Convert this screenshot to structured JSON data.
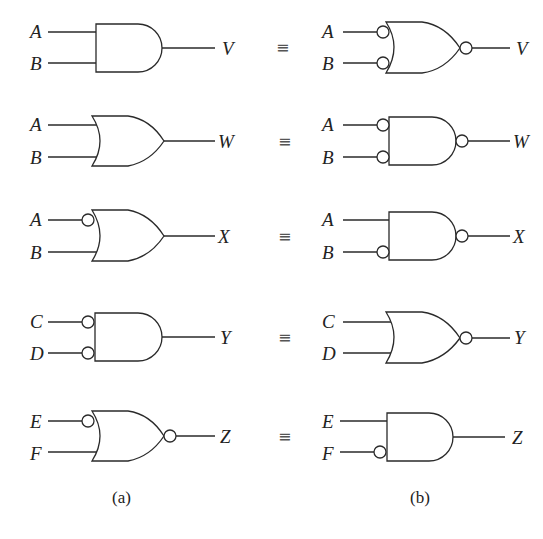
{
  "figure": {
    "rows": [
      {
        "left": {
          "type": "AND",
          "inputs": [
            "A",
            "B"
          ],
          "input_bubbles": [
            false,
            false
          ],
          "output_bubble": false,
          "output": "V"
        },
        "equiv": "≡",
        "right": {
          "type": "OR",
          "inputs": [
            "A",
            "B"
          ],
          "input_bubbles": [
            true,
            true
          ],
          "output_bubble": true,
          "output": "V"
        }
      },
      {
        "left": {
          "type": "OR",
          "inputs": [
            "A",
            "B"
          ],
          "input_bubbles": [
            false,
            false
          ],
          "output_bubble": false,
          "output": "W"
        },
        "equiv": "≡",
        "right": {
          "type": "AND",
          "inputs": [
            "A",
            "B"
          ],
          "input_bubbles": [
            true,
            true
          ],
          "output_bubble": true,
          "output": "W"
        }
      },
      {
        "left": {
          "type": "OR",
          "inputs": [
            "A",
            "B"
          ],
          "input_bubbles": [
            true,
            false
          ],
          "output_bubble": false,
          "output": "X"
        },
        "equiv": "≡",
        "right": {
          "type": "AND",
          "inputs": [
            "A",
            "B"
          ],
          "input_bubbles": [
            false,
            true
          ],
          "output_bubble": true,
          "output": "X"
        }
      },
      {
        "left": {
          "type": "AND",
          "inputs": [
            "C",
            "D"
          ],
          "input_bubbles": [
            true,
            true
          ],
          "output_bubble": false,
          "output": "Y"
        },
        "equiv": "≡",
        "right": {
          "type": "OR",
          "inputs": [
            "C",
            "D"
          ],
          "input_bubbles": [
            false,
            false
          ],
          "output_bubble": true,
          "output": "Y"
        }
      },
      {
        "left": {
          "type": "OR",
          "inputs": [
            "E",
            "F"
          ],
          "input_bubbles": [
            true,
            false
          ],
          "output_bubble": true,
          "output": "Z"
        },
        "equiv": "≡",
        "right": {
          "type": "AND",
          "inputs": [
            "E",
            "F"
          ],
          "input_bubbles": [
            false,
            true
          ],
          "output_bubble": false,
          "output": "Z"
        }
      }
    ],
    "captions": {
      "left": "(a)",
      "right": "(b)"
    }
  }
}
